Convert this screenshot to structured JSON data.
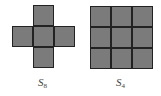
{
  "figures": [
    {
      "id": "cross",
      "label_main": "S",
      "label_sub": "8",
      "cells": [
        {
          "row": 0,
          "col": 1
        },
        {
          "row": 1,
          "col": 0
        },
        {
          "row": 1,
          "col": 1
        },
        {
          "row": 1,
          "col": 2
        },
        {
          "row": 2,
          "col": 1
        }
      ]
    },
    {
      "id": "square",
      "label_main": "S",
      "label_sub": "4",
      "cells": [
        {
          "row": 0,
          "col": 0
        },
        {
          "row": 0,
          "col": 1
        },
        {
          "row": 0,
          "col": 2
        },
        {
          "row": 1,
          "col": 0
        },
        {
          "row": 1,
          "col": 1
        },
        {
          "row": 1,
          "col": 2
        },
        {
          "row": 2,
          "col": 0
        },
        {
          "row": 2,
          "col": 1
        },
        {
          "row": 2,
          "col": 2
        }
      ]
    }
  ],
  "colors": {
    "fill": "#7b7b7b",
    "border": "#222222"
  }
}
